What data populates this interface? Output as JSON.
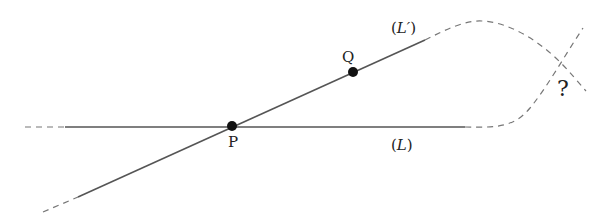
{
  "diagram": {
    "points": [
      {
        "id": "P",
        "label": "P",
        "x": 232,
        "y": 126
      },
      {
        "id": "Q",
        "label": "Q",
        "x": 353,
        "y": 72
      }
    ],
    "lines": [
      {
        "id": "L",
        "label_open": "(",
        "label_name": "L",
        "label_close": ")"
      },
      {
        "id": "L-prime",
        "label_open": "(",
        "label_name": "L′",
        "label_close": ")"
      }
    ],
    "unknown_intersection": {
      "label": "?"
    },
    "colors": {
      "line": "#555555",
      "dash": "#777777",
      "point": "#111111",
      "text": "#222222"
    }
  }
}
